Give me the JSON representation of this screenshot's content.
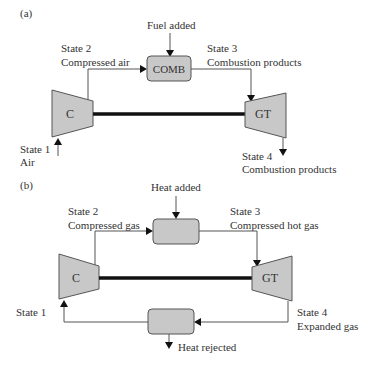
{
  "diagram_a": {
    "panel_label": "(a)",
    "fuel_label": "Fuel added",
    "state2": {
      "title": "State 2",
      "desc": "Compressed air"
    },
    "state3": {
      "title": "State 3",
      "desc": "Combustion products"
    },
    "state1": {
      "title": "State 1",
      "desc": "Air"
    },
    "state4": {
      "title": "State 4",
      "desc": "Combustion products"
    },
    "compressor_label": "C",
    "combustor_label": "COMB",
    "turbine_label": "GT"
  },
  "diagram_b": {
    "panel_label": "(b)",
    "heat_added_label": "Heat added",
    "state2": {
      "title": "State 2",
      "desc": "Compressed gas"
    },
    "state3": {
      "title": "State 3",
      "desc": "Compressed hot gas"
    },
    "state1": {
      "title": "State 1"
    },
    "state4": {
      "title": "State 4",
      "desc": "Expanded gas"
    },
    "compressor_label": "C",
    "turbine_label": "GT",
    "heat_rejected_label": "Heat rejected"
  },
  "colors": {
    "component_fill": "#c8c8c8",
    "line": "#555555",
    "shaft": "#111111"
  }
}
